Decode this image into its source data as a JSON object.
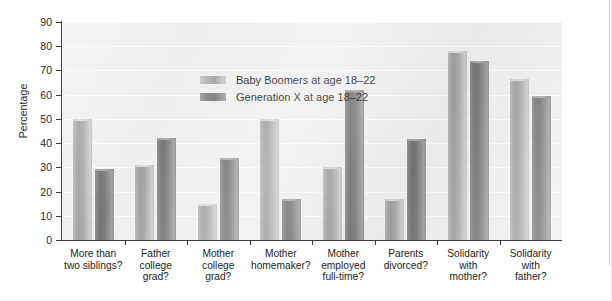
{
  "chart_data": {
    "type": "bar",
    "title": "",
    "xlabel": "",
    "ylabel": "Percentage",
    "ylim": [
      0,
      90
    ],
    "ytick_step": 10,
    "yticks": [
      "90",
      "80",
      "70",
      "60",
      "50",
      "40",
      "30",
      "20",
      "10",
      "0"
    ],
    "grid": true,
    "grid_axis": "y",
    "legend_position": "inside-top-left",
    "categories": [
      "More than\ntwo siblings?",
      "Father\ncollege\ngrad?",
      "Mother\ncollege\ngrad?",
      "Mother\nhomemaker?",
      "Mother\nemployed\nfull-time?",
      "Parents\ndivorced?",
      "Solidarity\nwith\nmother?",
      "Solidarity\nwith\nfather?"
    ],
    "series": [
      {
        "name": "Baby Boomers at age 18–22",
        "color": "#a9a9a9",
        "values": [
          50,
          31,
          15,
          50,
          30,
          17,
          78,
          66.5
        ]
      },
      {
        "name": "Generation X at age 18–22",
        "color": "#7e7e7e",
        "values": [
          29.5,
          42,
          34,
          17,
          62,
          41.5,
          74,
          59.5
        ]
      }
    ]
  },
  "legend": {
    "items": [
      {
        "label": "Baby Boomers at age 18–22",
        "swatch": "boomer"
      },
      {
        "label": "Generation X at age 18–22",
        "swatch": "genx"
      }
    ]
  },
  "axis": {
    "y_title": "Percentage"
  }
}
